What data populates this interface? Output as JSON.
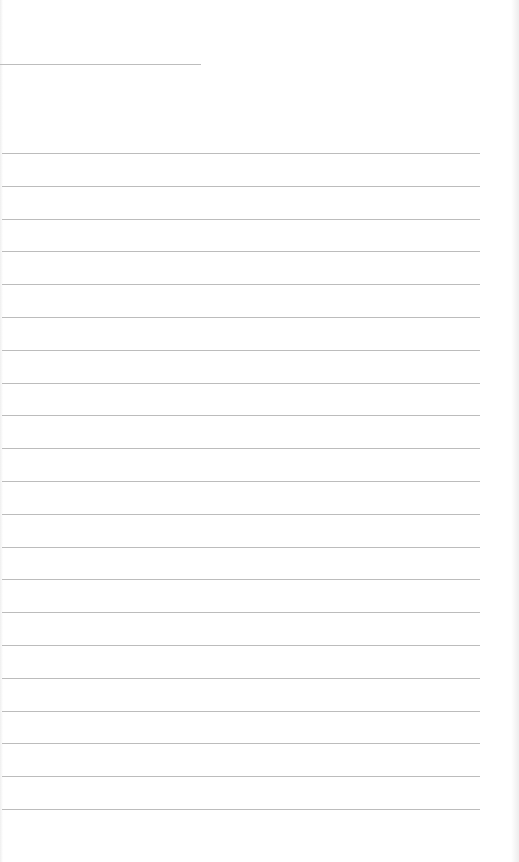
{
  "page": {
    "type": "lined-notepad",
    "background": "#ffffff",
    "line_color": "#bcbcbc",
    "header_line": {
      "y": 64,
      "x_end": 201,
      "text": ""
    },
    "ruled_lines": {
      "count": 21,
      "first_y": 153,
      "spacing": 32.8,
      "x_end": 480
    },
    "lines_text": [
      "",
      "",
      "",
      "",
      "",
      "",
      "",
      "",
      "",
      "",
      "",
      "",
      "",
      "",
      "",
      "",
      "",
      "",
      "",
      "",
      ""
    ]
  }
}
